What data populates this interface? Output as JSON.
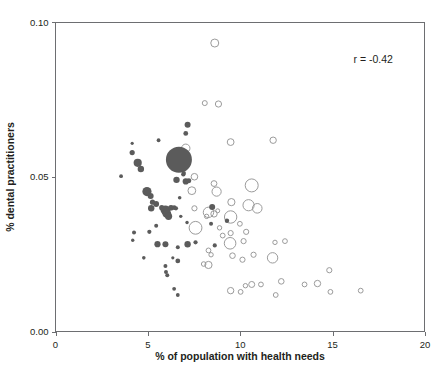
{
  "chart_data": {
    "type": "scatter",
    "title": "",
    "xlabel": "% of population with health needs",
    "ylabel": "% dental practitioners",
    "xlim": [
      0,
      20
    ],
    "ylim": [
      0.0,
      0.1
    ],
    "xticks": [
      "0",
      "5",
      "10",
      "15",
      "20"
    ],
    "xtick_values": [
      0,
      5,
      10,
      15,
      20
    ],
    "yticks": [
      "0.00",
      "0.05",
      "0.10"
    ],
    "ytick_values": [
      0.0,
      0.05,
      0.1
    ],
    "grid": false,
    "legend": null,
    "annotations": [
      {
        "text": "r = -0.42",
        "x": 17.2,
        "y": 0.0905
      }
    ],
    "colors": {
      "filled_marker": "#5b5b5b",
      "open_marker_stroke": "#9b9b9b",
      "axis": "#6d6e71",
      "text": "#231f20",
      "background": "#ffffff"
    },
    "series": [
      {
        "name": "filled",
        "style": "filled",
        "color": "#5b5b5b",
        "points": [
          {
            "x": 3.55,
            "y": 0.0502,
            "r": 1.9
          },
          {
            "x": 4.15,
            "y": 0.0578,
            "r": 2.6
          },
          {
            "x": 4.45,
            "y": 0.0545,
            "r": 4.1
          },
          {
            "x": 4.62,
            "y": 0.0525,
            "r": 3.2
          },
          {
            "x": 4.95,
            "y": 0.0452,
            "r": 4.6
          },
          {
            "x": 5.15,
            "y": 0.0438,
            "r": 3.0
          },
          {
            "x": 5.25,
            "y": 0.0418,
            "r": 2.6
          },
          {
            "x": 5.45,
            "y": 0.0412,
            "r": 2.9
          },
          {
            "x": 5.18,
            "y": 0.0398,
            "r": 3.2
          },
          {
            "x": 5.45,
            "y": 0.0342,
            "r": 2.0
          },
          {
            "x": 5.75,
            "y": 0.04,
            "r": 2.6
          },
          {
            "x": 5.95,
            "y": 0.0392,
            "r": 4.8
          },
          {
            "x": 6.02,
            "y": 0.0382,
            "r": 4.4
          },
          {
            "x": 6.12,
            "y": 0.0372,
            "r": 3.6
          },
          {
            "x": 6.25,
            "y": 0.04,
            "r": 2.8
          },
          {
            "x": 6.42,
            "y": 0.04,
            "r": 2.4
          },
          {
            "x": 6.52,
            "y": 0.0398,
            "r": 2.1
          },
          {
            "x": 6.68,
            "y": 0.0555,
            "r": 13.0
          },
          {
            "x": 6.92,
            "y": 0.0508,
            "r": 2.2
          },
          {
            "x": 6.55,
            "y": 0.049,
            "r": 3.2
          },
          {
            "x": 7.05,
            "y": 0.0485,
            "r": 3.1
          },
          {
            "x": 7.22,
            "y": 0.0487,
            "r": 2.4
          },
          {
            "x": 7.05,
            "y": 0.064,
            "r": 2.4
          },
          {
            "x": 7.15,
            "y": 0.0668,
            "r": 3.0
          },
          {
            "x": 4.15,
            "y": 0.0608,
            "r": 1.6
          },
          {
            "x": 5.58,
            "y": 0.0618,
            "r": 1.9
          },
          {
            "x": 6.78,
            "y": 0.0372,
            "r": 1.7
          },
          {
            "x": 7.12,
            "y": 0.0352,
            "r": 1.7
          },
          {
            "x": 4.25,
            "y": 0.032,
            "r": 2.0
          },
          {
            "x": 4.18,
            "y": 0.0295,
            "r": 1.7
          },
          {
            "x": 5.08,
            "y": 0.0322,
            "r": 2.1
          },
          {
            "x": 5.52,
            "y": 0.0282,
            "r": 3.1
          },
          {
            "x": 5.95,
            "y": 0.0282,
            "r": 3.0
          },
          {
            "x": 6.62,
            "y": 0.0272,
            "r": 2.0
          },
          {
            "x": 7.15,
            "y": 0.0282,
            "r": 3.2
          },
          {
            "x": 7.58,
            "y": 0.0288,
            "r": 2.1
          },
          {
            "x": 8.62,
            "y": 0.0278,
            "r": 2.1
          },
          {
            "x": 8.48,
            "y": 0.0402,
            "r": 3.0
          },
          {
            "x": 8.42,
            "y": 0.0348,
            "r": 2.0
          },
          {
            "x": 9.28,
            "y": 0.0358,
            "r": 2.2
          },
          {
            "x": 6.35,
            "y": 0.0238,
            "r": 1.6
          },
          {
            "x": 4.78,
            "y": 0.0238,
            "r": 1.8
          },
          {
            "x": 5.95,
            "y": 0.0212,
            "r": 2.0
          },
          {
            "x": 6.62,
            "y": 0.0228,
            "r": 2.4
          },
          {
            "x": 5.98,
            "y": 0.0192,
            "r": 2.0
          },
          {
            "x": 6.05,
            "y": 0.0182,
            "r": 2.0
          },
          {
            "x": 6.42,
            "y": 0.0138,
            "r": 1.9
          },
          {
            "x": 6.62,
            "y": 0.0118,
            "r": 1.9
          },
          {
            "x": 6.72,
            "y": 0.0432,
            "r": 1.8
          },
          {
            "x": 6.95,
            "y": 0.0512,
            "r": 2.0
          }
        ]
      },
      {
        "name": "open",
        "style": "open",
        "color": "#9b9b9b",
        "points": [
          {
            "x": 8.62,
            "y": 0.0932,
            "r": 4.0
          },
          {
            "x": 8.08,
            "y": 0.0738,
            "r": 2.5
          },
          {
            "x": 8.82,
            "y": 0.0735,
            "r": 3.1
          },
          {
            "x": 9.48,
            "y": 0.0612,
            "r": 3.4
          },
          {
            "x": 11.78,
            "y": 0.0618,
            "r": 3.2
          },
          {
            "x": 7.05,
            "y": 0.0592,
            "r": 4.2
          },
          {
            "x": 7.52,
            "y": 0.05,
            "r": 3.3
          },
          {
            "x": 7.38,
            "y": 0.0455,
            "r": 3.9
          },
          {
            "x": 8.58,
            "y": 0.0478,
            "r": 2.9
          },
          {
            "x": 8.72,
            "y": 0.0452,
            "r": 4.6
          },
          {
            "x": 10.62,
            "y": 0.0472,
            "r": 6.5
          },
          {
            "x": 7.52,
            "y": 0.0398,
            "r": 2.6
          },
          {
            "x": 8.28,
            "y": 0.0385,
            "r": 5.2
          },
          {
            "x": 8.58,
            "y": 0.038,
            "r": 3.2
          },
          {
            "x": 9.52,
            "y": 0.0418,
            "r": 3.6
          },
          {
            "x": 10.45,
            "y": 0.0408,
            "r": 5.6
          },
          {
            "x": 10.92,
            "y": 0.0398,
            "r": 4.8
          },
          {
            "x": 9.48,
            "y": 0.037,
            "r": 6.2
          },
          {
            "x": 7.58,
            "y": 0.0335,
            "r": 6.4
          },
          {
            "x": 9.98,
            "y": 0.0348,
            "r": 2.4
          },
          {
            "x": 10.32,
            "y": 0.0322,
            "r": 2.6
          },
          {
            "x": 8.88,
            "y": 0.0335,
            "r": 2.2
          },
          {
            "x": 9.05,
            "y": 0.031,
            "r": 2.4
          },
          {
            "x": 9.48,
            "y": 0.0318,
            "r": 2.6
          },
          {
            "x": 9.45,
            "y": 0.0285,
            "r": 5.8
          },
          {
            "x": 10.18,
            "y": 0.0292,
            "r": 2.6
          },
          {
            "x": 11.88,
            "y": 0.0288,
            "r": 2.2
          },
          {
            "x": 12.42,
            "y": 0.0292,
            "r": 2.4
          },
          {
            "x": 8.28,
            "y": 0.0262,
            "r": 2.4
          },
          {
            "x": 8.42,
            "y": 0.0248,
            "r": 2.2
          },
          {
            "x": 9.58,
            "y": 0.0245,
            "r": 2.8
          },
          {
            "x": 10.12,
            "y": 0.0232,
            "r": 2.6
          },
          {
            "x": 10.72,
            "y": 0.0248,
            "r": 2.6
          },
          {
            "x": 11.75,
            "y": 0.0238,
            "r": 5.2
          },
          {
            "x": 8.02,
            "y": 0.0218,
            "r": 2.3
          },
          {
            "x": 8.28,
            "y": 0.0215,
            "r": 3.6
          },
          {
            "x": 14.82,
            "y": 0.0198,
            "r": 2.6
          },
          {
            "x": 12.22,
            "y": 0.0162,
            "r": 2.8
          },
          {
            "x": 13.48,
            "y": 0.0152,
            "r": 2.4
          },
          {
            "x": 14.18,
            "y": 0.0155,
            "r": 3.2
          },
          {
            "x": 16.52,
            "y": 0.0132,
            "r": 2.4
          },
          {
            "x": 14.88,
            "y": 0.0128,
            "r": 2.4
          },
          {
            "x": 10.28,
            "y": 0.0148,
            "r": 2.2
          },
          {
            "x": 10.62,
            "y": 0.0152,
            "r": 3.0
          },
          {
            "x": 11.12,
            "y": 0.0152,
            "r": 2.4
          },
          {
            "x": 9.48,
            "y": 0.0132,
            "r": 3.2
          },
          {
            "x": 10.02,
            "y": 0.0128,
            "r": 2.4
          },
          {
            "x": 11.92,
            "y": 0.0118,
            "r": 2.4
          },
          {
            "x": 8.78,
            "y": 0.039,
            "r": 2.0
          },
          {
            "x": 8.18,
            "y": 0.0372,
            "r": 2.2
          }
        ]
      }
    ]
  },
  "axes": {
    "y_label": "% dental practitioners",
    "x_label": "% of population with health needs"
  },
  "annotation": {
    "correlation": "r = -0.42"
  }
}
